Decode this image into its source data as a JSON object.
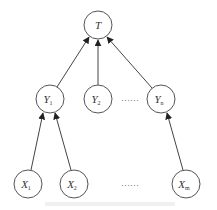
{
  "diagram": {
    "type": "tree",
    "root": {
      "id": "T",
      "label": "T",
      "x": 98,
      "y": 25
    },
    "middle_layer": [
      {
        "id": "Y1",
        "label": "Y",
        "sub": "1",
        "x": 50,
        "y": 99
      },
      {
        "id": "Y2",
        "label": "Y",
        "sub": "2",
        "x": 98,
        "y": 99
      },
      {
        "id": "Yn",
        "label": "Y",
        "sub": "n",
        "x": 161,
        "y": 99
      }
    ],
    "bottom_layer": [
      {
        "id": "X1",
        "label": "X",
        "sub": "1",
        "x": 28,
        "y": 184
      },
      {
        "id": "X2",
        "label": "X",
        "sub": "2",
        "x": 74,
        "y": 184
      },
      {
        "id": "Xm",
        "label": "X",
        "sub": "m",
        "x": 186,
        "y": 184
      }
    ],
    "edges": [
      {
        "from": "Y1",
        "to": "T"
      },
      {
        "from": "Y2",
        "to": "T"
      },
      {
        "from": "Yn",
        "to": "T"
      },
      {
        "from": "X1",
        "to": "Y1"
      },
      {
        "from": "X2",
        "to": "Y1"
      },
      {
        "from": "Xm",
        "to": "Yn"
      }
    ],
    "ellipsis_middle": "……",
    "ellipsis_bottom": "……",
    "colors": {
      "stroke": "#555555",
      "text": "#333333"
    }
  }
}
